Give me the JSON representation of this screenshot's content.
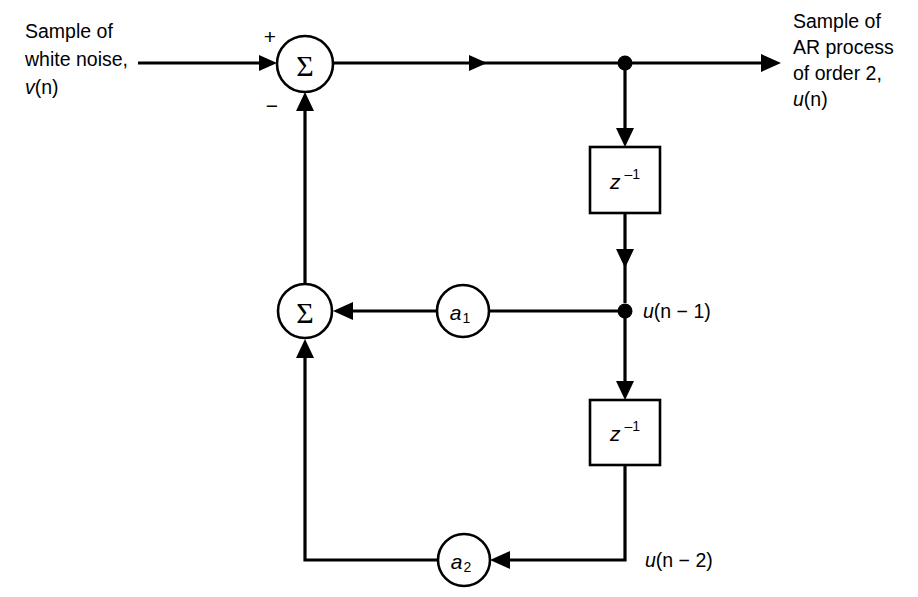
{
  "diagram": {
    "type": "signal-flow-diagram",
    "colors": {
      "background": "#ffffff",
      "stroke": "#000000",
      "node_fill": "#ffffff"
    },
    "input_caption": {
      "line1": "Sample of",
      "line2": "white noise,",
      "line3_var": "v",
      "line3_arg": "(n)"
    },
    "output_caption": {
      "line1": "Sample of",
      "line2": "AR process",
      "line3": "of order 2,",
      "line4_var": "u",
      "line4_arg": "(n)"
    },
    "adders": [
      {
        "name": "top-summing-junction",
        "glyph": "Σ",
        "plus_sign": "+",
        "minus_sign": "−"
      },
      {
        "name": "feedback-summing-junction",
        "glyph": "Σ"
      }
    ],
    "delay_blocks": [
      {
        "name": "delay-block-1",
        "symbol": "z",
        "exponent": "–1"
      },
      {
        "name": "delay-block-2",
        "symbol": "z",
        "exponent": "–1"
      }
    ],
    "gain_blocks": [
      {
        "name": "gain-a1",
        "symbol": "a",
        "subscript": "1"
      },
      {
        "name": "gain-a2",
        "symbol": "a",
        "subscript": "2"
      }
    ],
    "tap_labels": [
      {
        "name": "tap-label-un1",
        "var": "u",
        "expr": "(n − 1)"
      },
      {
        "name": "tap-label-un2",
        "var": "u",
        "expr": "(n − 2)"
      }
    ]
  }
}
